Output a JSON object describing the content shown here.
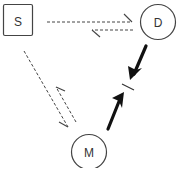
{
  "diagram": {
    "colors": {
      "stroke": "#444444",
      "bold_stroke": "#111111",
      "background": "#ffffff"
    },
    "nodes": [
      {
        "id": "S",
        "label": "S",
        "shape": "square"
      },
      {
        "id": "D",
        "label": "D",
        "shape": "circle"
      },
      {
        "id": "M",
        "label": "M",
        "shape": "circle"
      }
    ],
    "edges": [
      {
        "from": "S",
        "to": "D",
        "style": "dashed",
        "arrow": "half"
      },
      {
        "from": "D",
        "to": "S",
        "style": "dashed",
        "arrow": "half"
      },
      {
        "from": "S",
        "to": "M",
        "style": "dashed",
        "arrow": "half"
      },
      {
        "from": "M",
        "to": "S",
        "style": "dashed",
        "arrow": "half"
      },
      {
        "from": "D",
        "to": "block",
        "style": "bold",
        "arrow": "full"
      },
      {
        "from": "M",
        "to": "block",
        "style": "bold",
        "arrow": "full"
      }
    ],
    "block_marker": "bar"
  }
}
